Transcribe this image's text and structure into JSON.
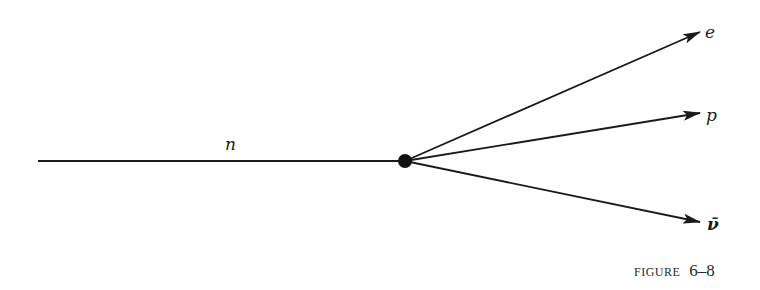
{
  "figure": {
    "caption_prefix": "FIGURE",
    "caption_number": "6–8"
  },
  "colors": {
    "background": "#ffffff",
    "ink": "#1a1a1a"
  },
  "vertex": {
    "x": 405,
    "y": 161,
    "r": 7
  },
  "incoming": {
    "label": "n",
    "x1": 38,
    "y1": 161,
    "label_x": 225,
    "label_y": 150
  },
  "outgoing": [
    {
      "label": "e",
      "x2": 700,
      "y2": 32,
      "label_x": 705,
      "label_y": 38
    },
    {
      "label": "p",
      "x2": 700,
      "y2": 113,
      "label_x": 706,
      "label_y": 121
    },
    {
      "label": "ν̄",
      "x2": 700,
      "y2": 222,
      "label_x": 707,
      "label_y": 230
    }
  ]
}
